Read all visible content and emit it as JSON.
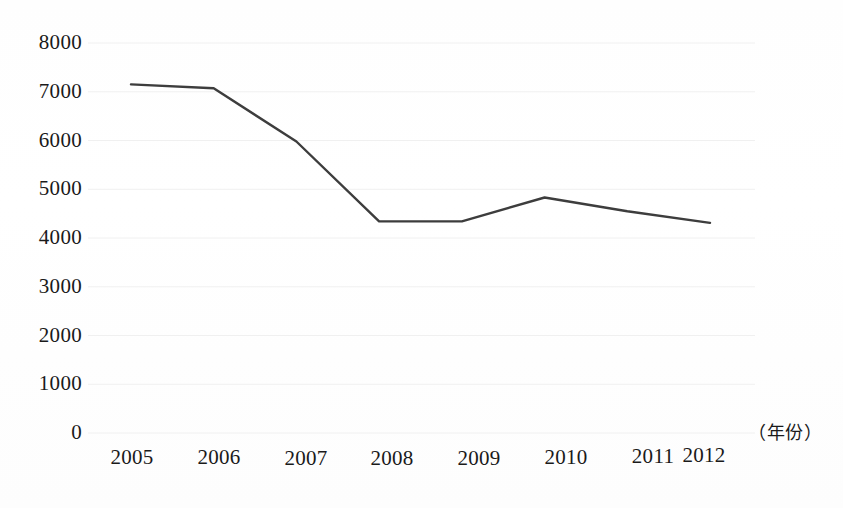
{
  "chart_data": {
    "type": "line",
    "title": "",
    "xlabel": "（年份）",
    "ylabel": "",
    "categories": [
      "2005",
      "2006",
      "2007",
      "2008",
      "2009",
      "2010",
      "2011",
      "2012"
    ],
    "values": [
      7150,
      7070,
      5980,
      4340,
      4340,
      4830,
      4550,
      4310
    ],
    "series": [
      {
        "name": "",
        "values": [
          7150,
          7070,
          5980,
          4340,
          4340,
          4830,
          4550,
          4310
        ]
      }
    ],
    "ylim": [
      0,
      8000
    ],
    "ytick_labels": [
      "0",
      "1000",
      "2000",
      "3000",
      "4000",
      "5000",
      "6000",
      "7000",
      "8000"
    ],
    "ytick_values": [
      0,
      1000,
      2000,
      3000,
      4000,
      5000,
      6000,
      7000,
      8000
    ],
    "grid": true,
    "legend": "none",
    "line_color": "#3d3d3d",
    "grid_color": "#f0f0f0"
  }
}
